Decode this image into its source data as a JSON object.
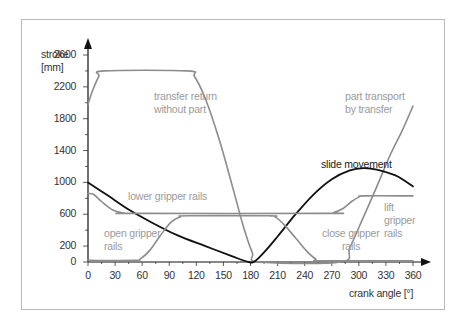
{
  "chart_data": {
    "type": "line",
    "title": "",
    "xlabel": "crank angle [°]",
    "ylabel": "stroke [mm]",
    "xlim": [
      0,
      360
    ],
    "ylim": [
      0,
      2700
    ],
    "x_ticks": [
      0,
      30,
      60,
      90,
      120,
      150,
      180,
      210,
      240,
      270,
      300,
      330,
      360
    ],
    "y_ticks": [
      0,
      200,
      600,
      1000,
      1400,
      1800,
      2200,
      2600
    ],
    "grid": false,
    "legend": "inline annotations",
    "series": [
      {
        "name": "transfer return without part / part transport by transfer",
        "color": "#8c8c8c",
        "points": [
          [
            0,
            1980
          ],
          [
            5,
            2150
          ],
          [
            12,
            2330
          ],
          [
            18,
            2400
          ],
          [
            110,
            2400
          ],
          [
            118,
            2330
          ],
          [
            130,
            2050
          ],
          [
            145,
            1550
          ],
          [
            160,
            950
          ],
          [
            172,
            450
          ],
          [
            182,
            120
          ],
          [
            190,
            0
          ],
          [
            280,
            0
          ],
          [
            290,
            180
          ],
          [
            305,
            560
          ],
          [
            320,
            950
          ],
          [
            335,
            1350
          ],
          [
            348,
            1650
          ],
          [
            360,
            1960
          ]
        ]
      },
      {
        "name": "slide movement",
        "color": "#111111",
        "points": [
          [
            0,
            1000
          ],
          [
            20,
            850
          ],
          [
            45,
            660
          ],
          [
            70,
            500
          ],
          [
            100,
            330
          ],
          [
            130,
            200
          ],
          [
            160,
            70
          ],
          [
            178,
            0
          ],
          [
            185,
            10
          ],
          [
            195,
            120
          ],
          [
            210,
            320
          ],
          [
            230,
            600
          ],
          [
            250,
            850
          ],
          [
            270,
            1040
          ],
          [
            290,
            1150
          ],
          [
            305,
            1180
          ],
          [
            320,
            1160
          ],
          [
            340,
            1090
          ],
          [
            352,
            1010
          ],
          [
            360,
            950
          ]
        ]
      },
      {
        "name": "lower gripper rails / lift gripper rails",
        "color": "#8c8c8c",
        "points": [
          [
            0,
            860
          ],
          [
            6,
            850
          ],
          [
            15,
            760
          ],
          [
            28,
            650
          ],
          [
            40,
            615
          ],
          [
            50,
            610
          ],
          [
            265,
            610
          ],
          [
            272,
            620
          ],
          [
            282,
            670
          ],
          [
            292,
            760
          ],
          [
            300,
            815
          ],
          [
            306,
            830
          ],
          [
            360,
            830
          ]
        ]
      },
      {
        "name": "open gripper rails / close gripper rails",
        "color": "#8c8c8c",
        "points": [
          [
            0,
            20
          ],
          [
            52,
            20
          ],
          [
            58,
            40
          ],
          [
            68,
            140
          ],
          [
            80,
            330
          ],
          [
            92,
            500
          ],
          [
            102,
            565
          ],
          [
            110,
            580
          ],
          [
            200,
            580
          ],
          [
            208,
            560
          ],
          [
            218,
            460
          ],
          [
            230,
            300
          ],
          [
            242,
            140
          ],
          [
            252,
            40
          ],
          [
            260,
            15
          ],
          [
            360,
            15
          ]
        ]
      }
    ],
    "annotations": [
      {
        "text": "transfer return",
        "x": 125,
        "y": 2050
      },
      {
        "text": "without part",
        "x": 125,
        "y": 1900
      },
      {
        "text": "part transport",
        "x": 317,
        "y": 1900
      },
      {
        "text": "by transfer",
        "x": 317,
        "y": 1750
      },
      {
        "text": "slide movement",
        "x": 260,
        "y": 1180
      },
      {
        "text": "lower gripper rails",
        "x": 70,
        "y": 770
      },
      {
        "text": "lift",
        "x": 336,
        "y": 680
      },
      {
        "text": "gripper",
        "x": 336,
        "y": 530
      },
      {
        "text": "rails",
        "x": 336,
        "y": 380
      },
      {
        "text": "open gripper",
        "x": 28,
        "y": 420
      },
      {
        "text": "rails",
        "x": 28,
        "y": 270
      },
      {
        "text": "close gripper",
        "x": 270,
        "y": 420
      },
      {
        "text": "rails",
        "x": 290,
        "y": 270
      }
    ]
  },
  "labels": {
    "y_title_line1": "stroke",
    "y_title_line2": "[mm]",
    "x_title": "crank angle  [°]",
    "transfer_return_1": "transfer return",
    "transfer_return_2": "without part",
    "part_transport_1": "part transport",
    "part_transport_2": "by transfer",
    "slide_movement": "slide movement",
    "lower_gripper": "lower gripper rails",
    "lift_1": "lift",
    "lift_2": "gripper",
    "lift_3": "rails",
    "open_1": "open gripper",
    "open_2": "rails",
    "close_1": "close gripper",
    "close_2": "rails"
  }
}
